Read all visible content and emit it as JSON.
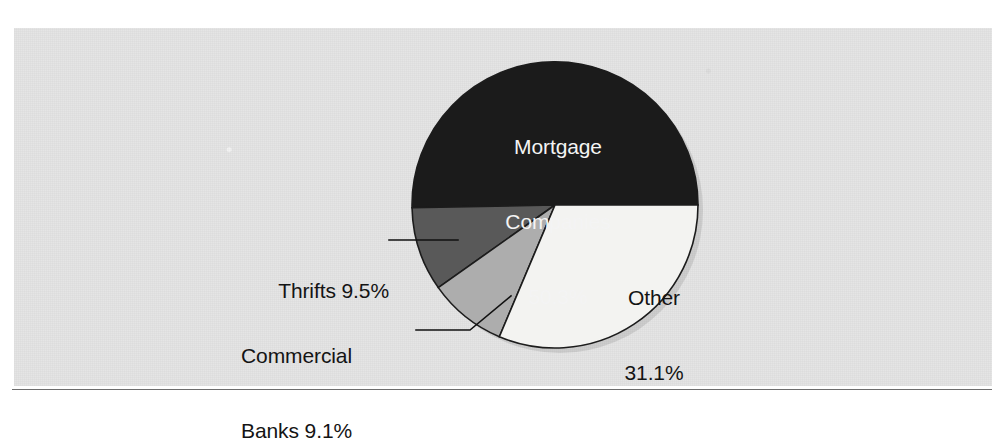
{
  "figure": {
    "background_color": "#e4e4e4",
    "page_color": "#ffffff",
    "rule_color": "#6e6e6e"
  },
  "chart_data": {
    "type": "pie",
    "title": "",
    "subtitle": "",
    "xlabel": "",
    "ylabel": "",
    "legend_position": "none",
    "grid": false,
    "units": "percent",
    "total": 100.0,
    "categories": [
      "Mortgage Companies",
      "Other",
      "Thrifts",
      "Commercial Banks"
    ],
    "values": [
      50.3,
      31.1,
      9.5,
      9.1
    ],
    "slices": [
      {
        "name": "Mortgage Companies",
        "value": 50.3,
        "value_label": "50.3%",
        "label_line1": "Mortgage",
        "label_line2": "Companies",
        "label_line3": "50.3%",
        "color": "#1b1b1b",
        "text_color": "#f4f4f4",
        "label_placement": "inside",
        "start_angle_deg": 0.0,
        "end_angle_deg": 181.1,
        "direction": "counterclockwise"
      },
      {
        "name": "Other",
        "value": 31.1,
        "value_label": "31.1%",
        "label_line1": "Other",
        "label_line2": "31.1%",
        "color": "#f3f3f1",
        "text_color": "#141414",
        "label_placement": "inside",
        "start_angle_deg": 247.1,
        "end_angle_deg": 360.0,
        "direction": "clockwise"
      },
      {
        "name": "Thrifts",
        "value": 9.5,
        "value_label": "9.5%",
        "label_text": "Thrifts 9.5%",
        "color": "#595959",
        "text_color": "#141414",
        "label_placement": "outside-left",
        "start_angle_deg": 181.1,
        "end_angle_deg": 215.3,
        "direction": "clockwise"
      },
      {
        "name": "Commercial Banks",
        "value": 9.1,
        "value_label": "9.1%",
        "label_line1": "Commercial",
        "label_line2": "Banks 9.1%",
        "color": "#adadad",
        "text_color": "#141414",
        "label_placement": "outside-left",
        "start_angle_deg": 215.3,
        "end_angle_deg": 247.1,
        "direction": "clockwise"
      }
    ],
    "geometry": {
      "center_x": 555,
      "center_y": 205,
      "radius": 143,
      "outline_color": "#1c1c1c"
    }
  },
  "labels": {
    "mortgage_line1": "Mortgage",
    "mortgage_line2": "Companies",
    "mortgage_line3": "50.3%",
    "other_line1": "Other",
    "other_line2": "31.1%",
    "thrifts": "Thrifts 9.5%",
    "commercial_line1": "Commercial",
    "commercial_line2": "Banks 9.1%"
  }
}
